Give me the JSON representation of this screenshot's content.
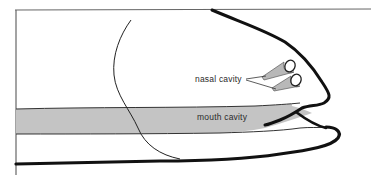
{
  "diagram": {
    "labels": {
      "nasal_cavity": "nasal cavity",
      "mouth_cavity": "mouth cavity"
    },
    "colors": {
      "outline": "#1a1a1a",
      "mouth_fill": "#c4c4c4",
      "nasal_fill": "#b8b8b8",
      "background": "#ffffff",
      "frame": "#555555"
    }
  }
}
